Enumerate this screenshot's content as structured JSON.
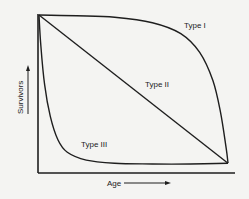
{
  "chart_data": {
    "type": "line",
    "title": "",
    "xlabel": "Age",
    "ylabel": "Survivors",
    "xlim": [
      0,
      1
    ],
    "ylim": [
      0,
      1
    ],
    "grid": false,
    "legend": "none",
    "series": [
      {
        "name": "Type I",
        "x": [
          0,
          0.2,
          0.4,
          0.6,
          0.75,
          0.85,
          0.92,
          0.96,
          0.99,
          1.0
        ],
        "values": [
          1,
          0.995,
          0.985,
          0.95,
          0.88,
          0.76,
          0.58,
          0.38,
          0.15,
          0.05
        ]
      },
      {
        "name": "Type II",
        "x": [
          0,
          1
        ],
        "values": [
          1,
          0.05
        ]
      },
      {
        "name": "Type III",
        "x": [
          0,
          0.01,
          0.03,
          0.06,
          0.1,
          0.15,
          0.25,
          0.4,
          0.6,
          0.8,
          1.0
        ],
        "values": [
          1,
          0.8,
          0.55,
          0.35,
          0.2,
          0.12,
          0.07,
          0.05,
          0.045,
          0.045,
          0.05
        ]
      }
    ],
    "annotations": [
      {
        "text": "Type I",
        "near_series": "Type I",
        "position": "upper-right"
      },
      {
        "text": "Type II",
        "near_series": "Type II",
        "position": "center-right"
      },
      {
        "text": "Type III",
        "near_series": "Type III",
        "position": "lower-left"
      }
    ],
    "axis_arrows": true
  }
}
